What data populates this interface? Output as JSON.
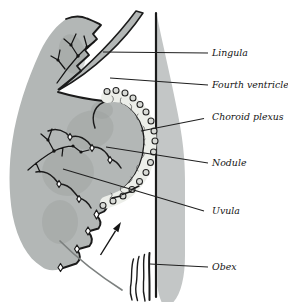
{
  "figure": {
    "type": "anatomical-line-diagram",
    "labels": [
      {
        "id": "lingula",
        "text": "Lingula"
      },
      {
        "id": "fourth-ventricle",
        "text": "Fourth ventricle"
      },
      {
        "id": "choroid-plexus",
        "text": "Choroid plexus"
      },
      {
        "id": "nodule",
        "text": "Nodule"
      },
      {
        "id": "uvula",
        "text": "Uvula"
      },
      {
        "id": "obex",
        "text": "Obex"
      }
    ],
    "colors": {
      "background": "#ffffff",
      "tissue": "#b3b7b6",
      "tissue-shade": "#9aa09e",
      "brainstem-band": "#c3c6c6",
      "outline": "#1b1b1b",
      "plexus-fill": "#eceee9",
      "bead": "#d9dbd7",
      "arc": "#7c807f"
    }
  }
}
